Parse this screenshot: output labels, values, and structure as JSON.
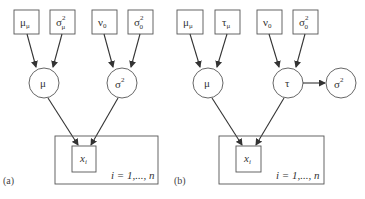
{
  "panels": [
    {
      "label": "(a)",
      "hyperparameters": [
        {
          "base": "μ",
          "sub": "μ",
          "sup": ""
        },
        {
          "base": "σ",
          "sub": "μ",
          "sup": "2"
        },
        {
          "base": "ν",
          "sub": "0",
          "sup": ""
        },
        {
          "base": "σ",
          "sub": "0",
          "sup": "2"
        }
      ],
      "parameters": [
        {
          "base": "μ",
          "sup": ""
        },
        {
          "base": "σ",
          "sup": "2"
        }
      ],
      "observed": {
        "base": "x",
        "sub": "i"
      },
      "plate_label": "i = 1,..., n"
    },
    {
      "label": "(b)",
      "hyperparameters": [
        {
          "base": "μ",
          "sub": "μ",
          "sup": ""
        },
        {
          "base": "τ",
          "sub": "μ",
          "sup": ""
        },
        {
          "base": "ν",
          "sub": "0",
          "sup": ""
        },
        {
          "base": "σ",
          "sub": "0",
          "sup": "2"
        }
      ],
      "parameters": [
        {
          "base": "μ",
          "sup": ""
        },
        {
          "base": "τ",
          "sup": ""
        },
        {
          "base": "σ",
          "sup": "2"
        }
      ],
      "observed": {
        "base": "x",
        "sub": "i"
      },
      "plate_label": "i = 1,..., n"
    }
  ]
}
